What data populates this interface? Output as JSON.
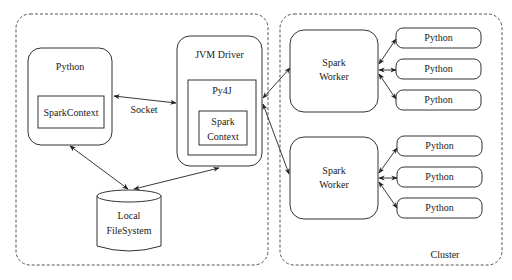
{
  "diagram": {
    "containers": {
      "driver_side": {
        "label": ""
      },
      "cluster": {
        "label": "Cluster"
      }
    },
    "nodes": {
      "python_driver": {
        "label": "Python",
        "inner": "SparkContext"
      },
      "jvm_driver": {
        "label": "JVM Driver",
        "py4j": "Py4J",
        "inner_line1": "Spark",
        "inner_line2": "Context"
      },
      "local_fs": {
        "line1": "Local",
        "line2": "FileSystem"
      },
      "worker1": {
        "line1": "Spark",
        "line2": "Worker"
      },
      "worker2": {
        "line1": "Spark",
        "line2": "Worker"
      },
      "worker1_pythons": [
        "Python",
        "Python",
        "Python"
      ],
      "worker2_pythons": [
        "Python",
        "Python",
        "Python"
      ]
    },
    "edges": [
      {
        "from": "python_driver.SparkContext",
        "to": "jvm_driver.Py4J",
        "label": "Socket",
        "bidirectional": true
      },
      {
        "from": "python_driver",
        "to": "local_fs",
        "bidirectional": true
      },
      {
        "from": "jvm_driver",
        "to": "local_fs",
        "bidirectional": true
      },
      {
        "from": "jvm_driver",
        "to": "worker1",
        "bidirectional": true
      },
      {
        "from": "jvm_driver",
        "to": "worker2",
        "bidirectional": true
      },
      {
        "from": "worker1",
        "to": "worker1_pythons[0..2]",
        "bidirectional": true
      },
      {
        "from": "worker2",
        "to": "worker2_pythons[0..2]",
        "bidirectional": true
      }
    ],
    "colors": {
      "stroke": "#333333",
      "background": "#ffffff",
      "text": "#1a1a1a"
    }
  }
}
